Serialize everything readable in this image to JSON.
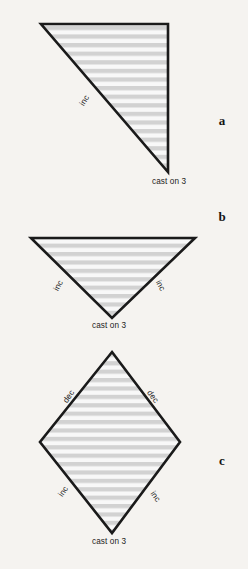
{
  "figure": {
    "background_color": "#f5f3f0",
    "outline_color": "#1a1a1a",
    "stripe_color": "#d2d2d2",
    "fill_color": "#f7f7f7",
    "text_color": "#1b1b1b"
  },
  "panels": [
    {
      "letter": "a",
      "shape": "right-triangle",
      "cast_on_label": "cast on 3",
      "edge_labels": [
        {
          "text": "inc",
          "rotation": -58
        }
      ]
    },
    {
      "letter": "b",
      "shape": "inverted-triangle",
      "cast_on_label": "cast on 3",
      "edge_labels": [
        {
          "text": "inc",
          "rotation": -62
        },
        {
          "text": "inc",
          "rotation": 62
        }
      ]
    },
    {
      "letter": "c",
      "shape": "diamond",
      "cast_on_label": "cast on 3",
      "edge_labels": [
        {
          "text": "dec",
          "rotation": -55
        },
        {
          "text": "dec",
          "rotation": 55
        },
        {
          "text": "inc",
          "rotation": -55
        },
        {
          "text": "inc",
          "rotation": 55
        }
      ]
    }
  ]
}
